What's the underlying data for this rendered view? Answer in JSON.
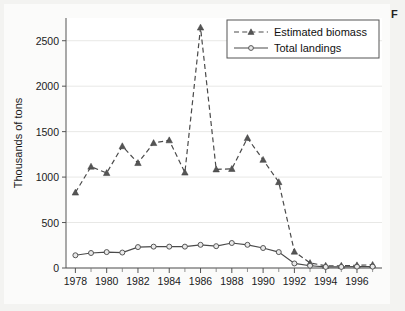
{
  "figure": {
    "corner_label": "F",
    "background": "#fbfbfa"
  },
  "chart_data": {
    "type": "line",
    "title": "",
    "xlabel": "",
    "ylabel": "Thousands of tons",
    "xlim": [
      1977.4,
      1997.6
    ],
    "ylim": [
      0,
      2750
    ],
    "yticks": [
      0,
      500,
      1000,
      1500,
      2000,
      2500
    ],
    "ytick_labels": [
      "0",
      "500",
      "1000",
      "1500",
      "2000",
      "2500"
    ],
    "xticks": [
      1978,
      1980,
      1982,
      1984,
      1986,
      1988,
      1990,
      1992,
      1994,
      1996
    ],
    "xtick_labels": [
      "1978",
      "1980",
      "1982",
      "1984",
      "1986",
      "1988",
      "1990",
      "1992",
      "1994",
      "1996"
    ],
    "x_minor_ticks": [
      1979,
      1981,
      1983,
      1985,
      1987,
      1989,
      1991,
      1993,
      1995,
      1997
    ],
    "x": [
      1978,
      1979,
      1980,
      1981,
      1982,
      1983,
      1984,
      1985,
      1986,
      1987,
      1988,
      1989,
      1990,
      1991,
      1992,
      1993,
      1994,
      1995,
      1996,
      1997
    ],
    "grid": true,
    "grid_axis": "y",
    "legend_position": "top-right",
    "series": [
      {
        "name": "Estimated biomass",
        "marker": "triangle",
        "linestyle": "dashed",
        "color": "#4a4a4a",
        "values": [
          830,
          1115,
          1045,
          1340,
          1155,
          1375,
          1405,
          1050,
          2645,
          1085,
          1090,
          1430,
          1190,
          945,
          180,
          55,
          25,
          25,
          30,
          35
        ]
      },
      {
        "name": "Total landings",
        "marker": "circle",
        "linestyle": "solid",
        "color": "#4a4a4a",
        "values": [
          140,
          165,
          175,
          170,
          230,
          235,
          235,
          235,
          255,
          240,
          275,
          255,
          220,
          175,
          50,
          25,
          12,
          12,
          15,
          15
        ]
      }
    ]
  }
}
